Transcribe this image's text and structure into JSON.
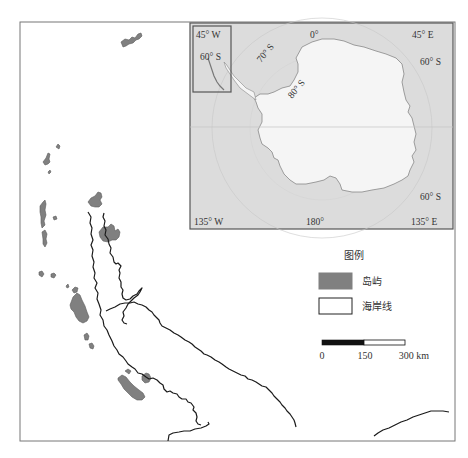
{
  "colors": {
    "island_fill": "#808080",
    "island_stroke": "#5a5a5a",
    "coastline": "#1a1a1a",
    "frame": "#666666",
    "inset_ocean": "#dcdcdc",
    "inset_land": "#f4f4f4",
    "background": "#ffffff"
  },
  "inset": {
    "labels": {
      "top_left_lon": "45° W",
      "top_center_lon": "0°",
      "top_right_lon": "45° E",
      "left_lat": "60° S",
      "lat_70": "70° S",
      "lat_80": "80° S",
      "right_upper_lat": "60° S",
      "right_lower_lat": "60° S",
      "bottom_left_lon": "135° W",
      "bottom_center_lon": "180°",
      "bottom_right_lon": "135° E"
    },
    "highlight_box": "study area"
  },
  "legend": {
    "title": "图例",
    "items": [
      {
        "label": "岛屿",
        "swatch": "filled-gray"
      },
      {
        "label": "海岸线",
        "swatch": "outline-white"
      }
    ]
  },
  "scale_bar": {
    "ticks": [
      "0",
      "150",
      "300 km"
    ]
  }
}
